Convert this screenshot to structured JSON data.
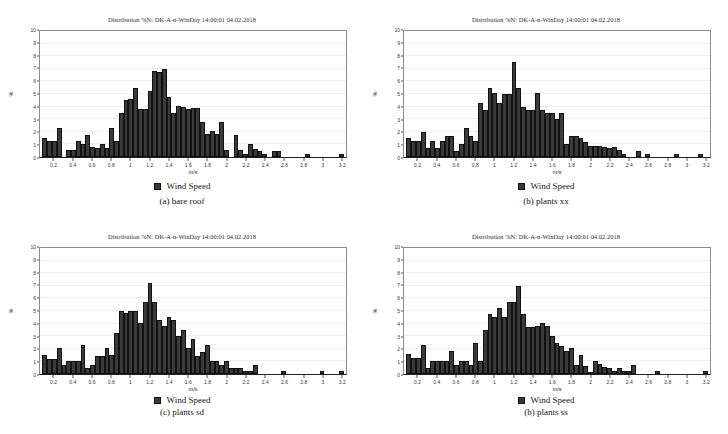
{
  "figure": {
    "layout": "2x2-grid",
    "background_color": "#ffffff",
    "bar_color": "#3a3a3a",
    "grid_color": "#eeeeee",
    "axis_color": "#555555"
  },
  "panels": [
    {
      "id": "panel-a",
      "title": "Distribution %N: DK-A-n-WinDay 14:00:01 04.02.2018",
      "legend_label": "Wind Speed",
      "caption": "(a) bare roof"
    },
    {
      "id": "panel-b",
      "title": "Distribution %N: DK-A-n-WinDay 14:00:01 04.02.2018",
      "legend_label": "Wind Speed",
      "caption": "(b) plants xx"
    },
    {
      "id": "panel-c",
      "title": "Distribution %N: DK-A-n-WinDay 14:00:01 04.02.2018",
      "legend_label": "Wind Speed",
      "caption": "(c) plants sd"
    },
    {
      "id": "panel-d",
      "title": "Distribution %N: DK-A-n-WinDay 14:00:01 04.02.2018",
      "legend_label": "Wind Speed",
      "caption": "(b) plants ss"
    }
  ],
  "chart_data": [
    {
      "type": "bar",
      "title": "Distribution %N: DK-A-n-WinDay 14:00:01 04.02.2018",
      "caption": "(a) bare roof",
      "xlabel": "m/s",
      "ylabel": "%",
      "xlim": [
        0.05,
        3.25
      ],
      "ylim": [
        0,
        10
      ],
      "ytick_labels": [
        "0",
        "1",
        "2",
        "3",
        "4",
        "5",
        "6",
        "7",
        "8",
        "9",
        "10"
      ],
      "xtick_labels": [
        "0.2",
        "0.4",
        "0.6",
        "0.8",
        "1",
        "1.2",
        "1.4",
        "1.6",
        "1.8",
        "2",
        "2.2",
        "2.4",
        "2.6",
        "2.8",
        "3",
        "3.2"
      ],
      "grid": true,
      "legend": [
        "Wind Speed"
      ],
      "legend_position": "below",
      "bin_width": 0.05,
      "x": [
        0.1,
        0.15,
        0.2,
        0.25,
        0.3,
        0.35,
        0.4,
        0.45,
        0.5,
        0.55,
        0.6,
        0.65,
        0.7,
        0.75,
        0.8,
        0.85,
        0.9,
        0.95,
        1.0,
        1.05,
        1.1,
        1.15,
        1.2,
        1.25,
        1.3,
        1.35,
        1.4,
        1.45,
        1.5,
        1.55,
        1.6,
        1.65,
        1.7,
        1.75,
        1.8,
        1.85,
        1.9,
        1.95,
        2.0,
        2.05,
        2.1,
        2.15,
        2.2,
        2.25,
        2.3,
        2.35,
        2.4,
        2.45,
        2.5,
        2.55,
        2.6,
        2.65,
        2.7,
        2.75,
        2.8,
        2.85,
        2.9,
        2.95,
        3.0,
        3.05,
        3.1,
        3.15,
        3.2
      ],
      "values": [
        1.5,
        1.25,
        1.25,
        2.3,
        0.0,
        0.55,
        0.55,
        1.25,
        1.05,
        1.75,
        0.8,
        0.75,
        1.05,
        0.75,
        2.3,
        1.25,
        3.5,
        4.5,
        4.6,
        5.5,
        3.8,
        3.8,
        5.25,
        6.8,
        6.75,
        7.0,
        4.8,
        3.5,
        4.05,
        4.0,
        3.85,
        3.9,
        3.9,
        2.8,
        1.8,
        2.1,
        1.8,
        2.8,
        0.55,
        0.0,
        1.75,
        0.55,
        0.2,
        1.05,
        0.65,
        0.45,
        0.2,
        0.0,
        0.5,
        0.5,
        0.0,
        0.0,
        0.0,
        0.0,
        0.0,
        0.2,
        0.0,
        0.0,
        0.0,
        0.0,
        0.0,
        0.0,
        0.2
      ]
    },
    {
      "type": "bar",
      "title": "Distribution %N: DK-A-n-WinDay 14:00:01 04.02.2018",
      "caption": "(b) plants xx",
      "xlabel": "m/s",
      "ylabel": "%",
      "xlim": [
        0.05,
        3.25
      ],
      "ylim": [
        0,
        10
      ],
      "ytick_labels": [
        "0",
        "1",
        "2",
        "3",
        "4",
        "5",
        "6",
        "7",
        "8",
        "9",
        "10"
      ],
      "xtick_labels": [
        "0.2",
        "0.4",
        "0.6",
        "0.8",
        "1",
        "1.2",
        "1.4",
        "1.6",
        "1.8",
        "2",
        "2.2",
        "2.4",
        "2.6",
        "2.8",
        "3",
        "3.2"
      ],
      "grid": true,
      "legend": [
        "Wind Speed"
      ],
      "legend_position": "below",
      "bin_width": 0.05,
      "x": [
        0.1,
        0.15,
        0.2,
        0.25,
        0.3,
        0.35,
        0.4,
        0.45,
        0.5,
        0.55,
        0.6,
        0.65,
        0.7,
        0.75,
        0.8,
        0.85,
        0.9,
        0.95,
        1.0,
        1.05,
        1.1,
        1.15,
        1.2,
        1.25,
        1.3,
        1.35,
        1.4,
        1.45,
        1.5,
        1.55,
        1.6,
        1.65,
        1.7,
        1.75,
        1.8,
        1.85,
        1.9,
        1.95,
        2.0,
        2.05,
        2.1,
        2.15,
        2.2,
        2.25,
        2.3,
        2.35,
        2.4,
        2.45,
        2.5,
        2.55,
        2.6,
        2.65,
        2.7,
        2.75,
        2.8,
        2.85,
        2.9,
        2.95,
        3.0,
        3.05,
        3.1,
        3.15,
        3.2
      ],
      "values": [
        1.5,
        1.25,
        1.25,
        2.0,
        0.75,
        1.25,
        0.75,
        1.3,
        1.65,
        1.7,
        0.5,
        1.05,
        2.3,
        1.7,
        1.25,
        4.3,
        3.75,
        5.5,
        5.05,
        4.3,
        5.0,
        5.0,
        7.55,
        5.5,
        4.0,
        3.7,
        3.7,
        5.05,
        3.7,
        3.5,
        3.5,
        3.0,
        3.5,
        1.0,
        1.7,
        1.7,
        1.5,
        1.2,
        0.9,
        0.85,
        0.85,
        0.8,
        0.75,
        0.8,
        0.55,
        0.2,
        0.0,
        0.0,
        0.45,
        0.0,
        0.2,
        0.0,
        0.0,
        0.0,
        0.0,
        0.0,
        0.25,
        0.0,
        0.0,
        0.0,
        0.0,
        0.25,
        0.0
      ]
    },
    {
      "type": "bar",
      "title": "Distribution %N: DK-A-n-WinDay 14:00:01 04.02.2018",
      "caption": "(c) plants sd",
      "xlabel": "m/s",
      "ylabel": "%",
      "xlim": [
        0.05,
        3.25
      ],
      "ylim": [
        0,
        10
      ],
      "ytick_labels": [
        "0",
        "1",
        "2",
        "3",
        "4",
        "5",
        "6",
        "7",
        "8",
        "9",
        "10"
      ],
      "xtick_labels": [
        "0.2",
        "0.4",
        "0.6",
        "0.8",
        "1",
        "1.2",
        "1.4",
        "1.6",
        "1.8",
        "2",
        "2.2",
        "2.4",
        "2.6",
        "2.8",
        "3",
        "3.2"
      ],
      "grid": true,
      "legend": [
        "Wind Speed"
      ],
      "legend_position": "below",
      "bin_width": 0.05,
      "x": [
        0.1,
        0.15,
        0.2,
        0.25,
        0.3,
        0.35,
        0.4,
        0.45,
        0.5,
        0.55,
        0.6,
        0.65,
        0.7,
        0.75,
        0.8,
        0.85,
        0.9,
        0.95,
        1.0,
        1.05,
        1.1,
        1.15,
        1.2,
        1.25,
        1.3,
        1.35,
        1.4,
        1.45,
        1.5,
        1.55,
        1.6,
        1.65,
        1.7,
        1.75,
        1.8,
        1.85,
        1.9,
        1.95,
        2.0,
        2.05,
        2.1,
        2.15,
        2.2,
        2.25,
        2.3,
        2.35,
        2.4,
        2.45,
        2.5,
        2.55,
        2.6,
        2.65,
        2.7,
        2.75,
        2.8,
        2.85,
        2.9,
        2.95,
        3.0,
        3.05,
        3.1,
        3.15,
        3.2
      ],
      "values": [
        1.5,
        1.2,
        1.2,
        2.05,
        0.75,
        1.0,
        1.0,
        1.0,
        2.3,
        0.5,
        0.7,
        1.45,
        1.45,
        2.05,
        1.5,
        3.25,
        5.0,
        4.85,
        5.0,
        5.0,
        4.05,
        5.75,
        7.2,
        5.75,
        4.25,
        3.8,
        4.5,
        4.25,
        3.05,
        3.5,
        2.05,
        2.8,
        1.45,
        1.75,
        2.3,
        1.05,
        1.05,
        0.75,
        1.0,
        0.45,
        0.45,
        0.45,
        0.2,
        0.2,
        0.7,
        0.0,
        0.0,
        0.0,
        0.0,
        0.0,
        0.25,
        0.0,
        0.0,
        0.0,
        0.0,
        0.0,
        0.0,
        0.0,
        0.25,
        0.0,
        0.0,
        0.0,
        0.25
      ]
    },
    {
      "type": "bar",
      "title": "Distribution %N: DK-A-n-WinDay 14:00:01 04.02.2018",
      "caption": "(b) plants ss",
      "xlabel": "m/s",
      "ylabel": "%",
      "xlim": [
        0.05,
        3.25
      ],
      "ylim": [
        0,
        10
      ],
      "ytick_labels": [
        "0",
        "1",
        "2",
        "3",
        "4",
        "5",
        "6",
        "7",
        "8",
        "9",
        "10"
      ],
      "xtick_labels": [
        "0.2",
        "0.4",
        "0.6",
        "0.8",
        "1",
        "1.2",
        "1.4",
        "1.6",
        "1.8",
        "2",
        "2.2",
        "2.4",
        "2.6",
        "2.8",
        "3",
        "3.2"
      ],
      "grid": true,
      "legend": [
        "Wind Speed"
      ],
      "legend_position": "below",
      "bin_width": 0.05,
      "x": [
        0.1,
        0.15,
        0.2,
        0.25,
        0.3,
        0.35,
        0.4,
        0.45,
        0.5,
        0.55,
        0.6,
        0.65,
        0.7,
        0.75,
        0.8,
        0.85,
        0.9,
        0.95,
        1.0,
        1.05,
        1.1,
        1.15,
        1.2,
        1.25,
        1.3,
        1.35,
        1.4,
        1.45,
        1.5,
        1.55,
        1.6,
        1.65,
        1.7,
        1.75,
        1.8,
        1.85,
        1.9,
        1.95,
        2.0,
        2.05,
        2.1,
        2.15,
        2.2,
        2.25,
        2.3,
        2.35,
        2.4,
        2.45,
        2.5,
        2.55,
        2.6,
        2.65,
        2.7,
        2.75,
        2.8,
        2.85,
        2.9,
        2.95,
        3.0,
        3.05,
        3.1,
        3.15,
        3.2
      ],
      "values": [
        1.55,
        1.3,
        1.25,
        2.3,
        0.5,
        1.0,
        1.0,
        1.0,
        1.05,
        1.8,
        0.75,
        1.0,
        1.0,
        0.7,
        2.5,
        1.05,
        3.5,
        4.75,
        4.5,
        5.25,
        4.5,
        5.7,
        5.75,
        7.0,
        4.8,
        3.7,
        3.7,
        3.8,
        4.05,
        3.8,
        3.0,
        2.5,
        2.2,
        1.8,
        2.1,
        0.7,
        1.5,
        0.65,
        0.15,
        1.0,
        0.8,
        0.55,
        0.45,
        0.25,
        0.45,
        0.2,
        0.25,
        0.7,
        0.0,
        0.0,
        0.0,
        0.0,
        0.2,
        0.0,
        0.0,
        0.0,
        0.0,
        0.0,
        0.0,
        0.0,
        0.0,
        0.0,
        0.2
      ]
    }
  ]
}
